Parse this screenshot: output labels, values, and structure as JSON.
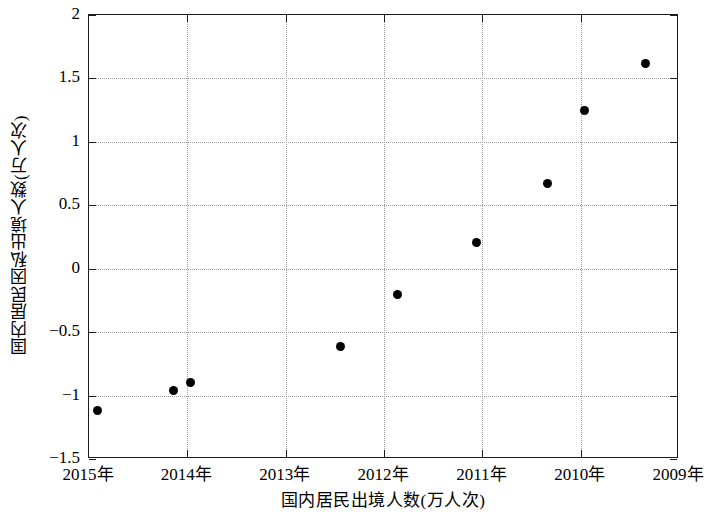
{
  "chart_data": {
    "type": "scatter",
    "title": "",
    "xlabel": "国内居民出境人数(万人次)",
    "ylabel": "国内居民因私出境人数(万人次)",
    "x_tick_labels": [
      "2015年",
      "2014年",
      "2013年",
      "2012年",
      "2011年",
      "2010年",
      "2009年"
    ],
    "y_tick_labels": [
      "2",
      "1.5",
      "1",
      "0.5",
      "0",
      "-0.5",
      "-1",
      "-1.5"
    ],
    "y_tick_values": [
      2,
      1.5,
      1,
      0.5,
      0,
      -0.5,
      -1,
      -1.5
    ],
    "ylim": [
      -1.5,
      2
    ],
    "xlim": [
      0,
      6
    ],
    "grid": true,
    "legend": null,
    "marker": "filled-circle",
    "marker_color": "#000000",
    "points": [
      {
        "x": 0.09,
        "y": -1.12
      },
      {
        "x": 0.86,
        "y": -0.96
      },
      {
        "x": 1.03,
        "y": -0.9
      },
      {
        "x": 2.56,
        "y": -0.61
      },
      {
        "x": 3.14,
        "y": -0.2
      },
      {
        "x": 3.94,
        "y": 0.21
      },
      {
        "x": 4.66,
        "y": 0.67
      },
      {
        "x": 5.04,
        "y": 1.25
      },
      {
        "x": 5.66,
        "y": 1.62
      }
    ],
    "x_values": [
      0.09,
      0.86,
      1.03,
      2.56,
      3.14,
      3.94,
      4.66,
      5.04,
      5.66
    ],
    "y_values": [
      -1.12,
      -0.96,
      -0.9,
      -0.61,
      -0.2,
      0.21,
      0.67,
      1.25,
      1.62
    ]
  },
  "axes": {
    "frame_color": "#1b1b1b",
    "grid_color": "#9a9a9a",
    "background": "#ffffff"
  }
}
